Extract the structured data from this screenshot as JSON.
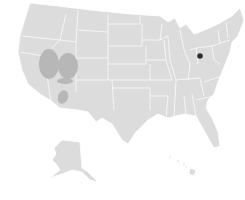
{
  "map": {
    "type": "us-states-choropleth",
    "base_color": "#dcdcdc",
    "border_color": "#ffffff",
    "background": "#ffffff",
    "highlight_color": "#b4b4b4",
    "marker_color": "#2f2f2f",
    "insets": [
      "alaska",
      "hawaii"
    ],
    "highlighted_regions": [
      {
        "name": "nevada-region",
        "cx": 49,
        "cy": 64,
        "rx": 10,
        "ry": 15
      },
      {
        "name": "utah-region",
        "cx": 68,
        "cy": 66,
        "rx": 10,
        "ry": 13
      },
      {
        "name": "utah-arizona-border-region",
        "cx": 65,
        "cy": 81,
        "rx": 8,
        "ry": 3
      },
      {
        "name": "arizona-region",
        "cx": 63,
        "cy": 97,
        "rx": 5,
        "ry": 7
      }
    ],
    "markers": [
      {
        "name": "ohio-marker",
        "cx": 200,
        "cy": 56,
        "r": 2.8
      }
    ]
  }
}
